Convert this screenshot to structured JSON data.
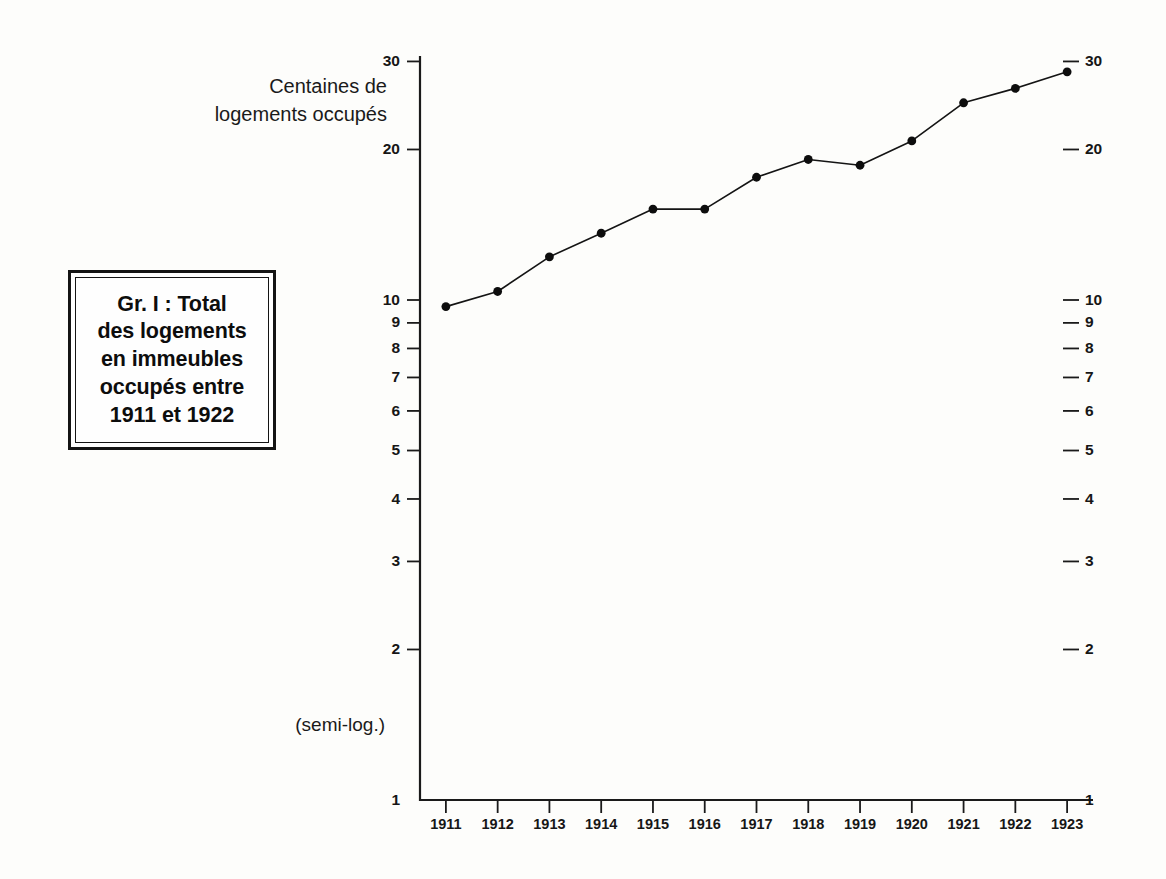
{
  "figure": {
    "title_label": "Gr. I : Total\ndes logements\nen immeubles\noccupés entre\n1911 et 1922",
    "y_caption": "Centaines de\nlogements occupés",
    "scale_note": "(semi-log.)",
    "ink_color": "#141414",
    "paper_color": "#fdfdfb"
  },
  "chart_data": {
    "type": "line",
    "title": "Gr. I : Total des logements en immeubles occupés entre 1911 et 1922",
    "xlabel": "",
    "ylabel": "Centaines de logements occupés",
    "annotation": "(semi-log.)",
    "yscale": "log",
    "ylim": [
      1,
      30
    ],
    "grid": false,
    "legend": "none",
    "categories": [
      "1911",
      "1912",
      "1913",
      "1914",
      "1915",
      "1916",
      "1917",
      "1918",
      "1919",
      "1920",
      "1921",
      "1922",
      "1923"
    ],
    "x": [
      1911,
      1912,
      1913,
      1914,
      1915,
      1916,
      1917,
      1918,
      1919,
      1920,
      1921,
      1922,
      1923
    ],
    "values": [
      9.7,
      10.4,
      12.2,
      13.6,
      15.2,
      15.2,
      17.6,
      19.1,
      18.6,
      20.8,
      24.8,
      26.5,
      28.6
    ],
    "series": [
      {
        "name": "Logements occupés",
        "values": [
          9.7,
          10.4,
          12.2,
          13.6,
          15.2,
          15.2,
          17.6,
          19.1,
          18.6,
          20.8,
          24.8,
          26.5,
          28.6
        ]
      }
    ],
    "y_ticks_left": [
      30,
      20,
      10,
      9,
      8,
      7,
      6,
      5,
      4,
      3,
      2,
      1
    ],
    "y_ticks_right": [
      30,
      20,
      10,
      9,
      8,
      7,
      6,
      5,
      4,
      3,
      2,
      1
    ],
    "x_ticks": [
      "1911",
      "1912",
      "1913",
      "1914",
      "1915",
      "1916",
      "1917",
      "1918",
      "1919",
      "1920",
      "1921",
      "1922",
      "1923"
    ]
  }
}
